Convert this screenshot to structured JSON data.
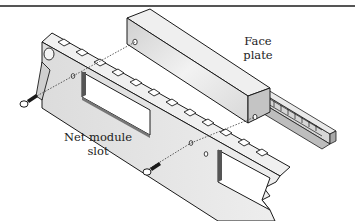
{
  "figure": {
    "type": "exploded-assembly-illustration",
    "labels": {
      "face_plate": [
        "Face",
        "plate"
      ],
      "net_module_slot": [
        "Net module",
        "slot"
      ]
    },
    "parts": [
      "chassis-rail",
      "face-plate",
      "net-module",
      "screw-left",
      "screw-bottom"
    ],
    "colors": {
      "metal_light": "#e4e4e4",
      "metal_mid": "#c8c8c8",
      "metal_dark": "#8a8a8a",
      "outline": "#1a1a1a",
      "rule": "#555555"
    }
  }
}
